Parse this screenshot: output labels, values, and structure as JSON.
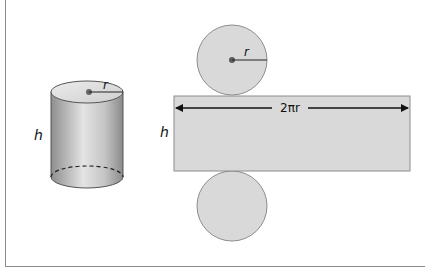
{
  "diagram": {
    "cylinder": {
      "height_label": "h",
      "radius_label": "r"
    },
    "net": {
      "top_circle": {
        "radius_label": "r"
      },
      "rectangle": {
        "width_label": "2πr",
        "height_label": "h"
      },
      "bottom_circle": {}
    },
    "colors": {
      "fill": "#d9d9d9",
      "outline": "#8c8c8c",
      "cylinder_side_dark": "#8f8f8f",
      "cylinder_side_light": "#e6e6e6",
      "center_dot": "#5a5a5a",
      "frame": "#8a8a8a"
    }
  }
}
